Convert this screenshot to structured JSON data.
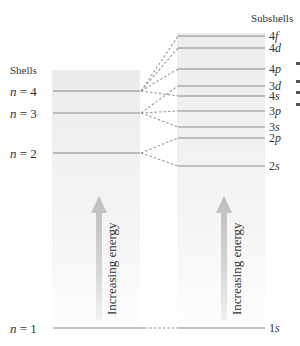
{
  "headers": {
    "shells": "Shells",
    "subshells": "Subshells"
  },
  "axis_label": "Increasing energy",
  "colors": {
    "line": "#8a8a8a",
    "dash": "#9a9a9a",
    "text": "#333333",
    "panel_top": "#ececec",
    "panel_bottom": "#fbfbfb",
    "arrow": "#c8c8c8"
  },
  "shells": [
    {
      "n": "4",
      "prefix": "n",
      "eq": " = ",
      "y": 91
    },
    {
      "n": "3",
      "prefix": "n",
      "eq": " = ",
      "y": 113
    },
    {
      "n": "2",
      "prefix": "n",
      "eq": " = ",
      "y": 153
    },
    {
      "n": "1",
      "prefix": "n",
      "eq": " = ",
      "y": 328
    }
  ],
  "subshells": [
    {
      "num": "4",
      "letter": "f",
      "y": 36,
      "parent": "4"
    },
    {
      "num": "4",
      "letter": "d",
      "y": 48,
      "parent": "4"
    },
    {
      "num": "4",
      "letter": "p",
      "y": 69,
      "parent": "4"
    },
    {
      "num": "3",
      "letter": "d",
      "y": 86,
      "parent": "3"
    },
    {
      "num": "4",
      "letter": "s",
      "y": 96,
      "parent": "4"
    },
    {
      "num": "3",
      "letter": "p",
      "y": 111,
      "parent": "3"
    },
    {
      "num": "3",
      "letter": "s",
      "y": 127,
      "parent": "3"
    },
    {
      "num": "2",
      "letter": "p",
      "y": 138,
      "parent": "2"
    },
    {
      "num": "2",
      "letter": "s",
      "y": 166,
      "parent": "2"
    },
    {
      "num": "1",
      "letter": "s",
      "y": 328,
      "parent": "1"
    }
  ]
}
